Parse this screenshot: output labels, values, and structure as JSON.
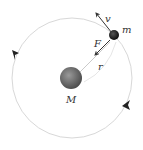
{
  "diagram": {
    "labels": {
      "velocity": "v",
      "small_mass": "m",
      "force": "F",
      "radius": "r",
      "central_mass": "M"
    },
    "colors": {
      "orbit": "#d8d8d8",
      "central_mass": "#6e6e6e",
      "small_mass": "#1a1a1a",
      "arrow": "#333333",
      "radius_line": "#bdbdbd"
    },
    "geometry": {
      "center": [
        72,
        78
      ],
      "orbit_radius": 60,
      "small_mass_position": [
        114,
        35
      ]
    }
  }
}
